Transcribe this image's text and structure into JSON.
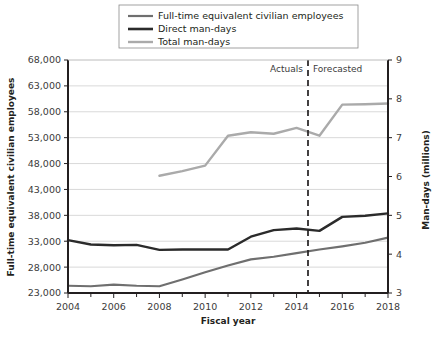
{
  "chart_data": {
    "type": "line",
    "title": "",
    "xlabel": "Fiscal year",
    "ylabel": "Full-time equivalent civilian employees",
    "y2label": "Man-days (millions)",
    "x": [
      2004,
      2005,
      2006,
      2007,
      2008,
      2009,
      2010,
      2011,
      2012,
      2013,
      2014,
      2015,
      2016,
      2017,
      2018
    ],
    "xlim": [
      2004,
      2018
    ],
    "xticks": [
      2004,
      2006,
      2008,
      2010,
      2012,
      2014,
      2016,
      2018
    ],
    "xtick_labels": [
      "2004",
      "2006",
      "2008",
      "2010",
      "2012",
      "2014",
      "2016",
      "2018"
    ],
    "xminor_step": 1,
    "ylim": [
      23000,
      68000
    ],
    "yticks": [
      23000,
      28000,
      33000,
      38000,
      43000,
      48000,
      53000,
      58000,
      63000,
      68000
    ],
    "ytick_labels": [
      "23,000",
      "28,000",
      "33,000",
      "38,000",
      "43,000",
      "48,000",
      "53,000",
      "58,000",
      "63,000",
      "68,000"
    ],
    "y2lim": [
      3,
      9
    ],
    "y2ticks": [
      3,
      4,
      5,
      6,
      7,
      8,
      9
    ],
    "y2tick_labels": [
      "3",
      "4",
      "5",
      "6",
      "7",
      "8",
      "9"
    ],
    "grid": true,
    "legend_position": "top-center",
    "series": [
      {
        "name": "Full-time equivalent civilian employees",
        "axis": "left",
        "color": "#6f6f6f",
        "width": 2.2,
        "values": [
          24400,
          24300,
          24600,
          24400,
          24300,
          25600,
          27000,
          28300,
          29500,
          30000,
          30700,
          31400,
          32000,
          32700,
          33700
        ]
      },
      {
        "name": "Direct man-days",
        "axis": "right",
        "color": "#2b2b2b",
        "width": 2.4,
        "values": [
          4.36,
          4.25,
          4.23,
          4.24,
          4.11,
          4.12,
          4.12,
          4.12,
          4.45,
          4.62,
          4.66,
          4.6,
          4.96,
          4.99,
          5.05
        ]
      },
      {
        "name": "Total man-days",
        "axis": "right",
        "color": "#aaaaaa",
        "width": 2.4,
        "start_index": 4,
        "values": [
          null,
          null,
          null,
          null,
          6.02,
          6.14,
          6.28,
          7.05,
          7.14,
          7.1,
          7.25,
          7.05,
          7.85,
          7.86,
          7.88
        ]
      }
    ],
    "annotations": [
      {
        "name": "forecast-divider",
        "type": "vline",
        "x": 2014.5,
        "style": "dashed",
        "color": "#231f20",
        "left_label": "Actuals",
        "right_label": "Forecasted"
      }
    ]
  },
  "legend": {
    "items": [
      {
        "label": "Full-time equivalent civilian employees",
        "color": "#6f6f6f"
      },
      {
        "label": "Direct man-days",
        "color": "#2b2b2b"
      },
      {
        "label": "Total man-days",
        "color": "#aaaaaa"
      }
    ]
  }
}
